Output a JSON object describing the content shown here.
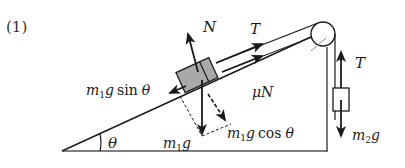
{
  "diagram": {
    "problem_number": "(1)",
    "colors": {
      "line": "#1a1a1a",
      "block_fill": "#a9a9a9",
      "background": "#ffffff"
    },
    "labels": {
      "normal_force": "N",
      "tension_incline": "T",
      "tension_hanging": "T",
      "friction": "μN",
      "weight_m1": "m₁g",
      "parallel_component": "m₁g sin θ",
      "perpendicular_component": "m₁g cos θ",
      "weight_m2": "m₂g",
      "angle": "θ"
    },
    "label_parts": {
      "m": "m",
      "sub1": "1",
      "sub2": "2",
      "g": "g",
      "sin": "sin",
      "cos": "cos",
      "theta": "θ",
      "mu": "μ",
      "N": "N",
      "T": "T"
    },
    "objects": [
      {
        "name": "incline",
        "description": "inclined plane at angle θ"
      },
      {
        "name": "block-m1",
        "description": "gray block on incline"
      },
      {
        "name": "pulley",
        "description": "pulley at top of incline"
      },
      {
        "name": "hanging-mass-m2",
        "description": "hanging box"
      }
    ]
  }
}
